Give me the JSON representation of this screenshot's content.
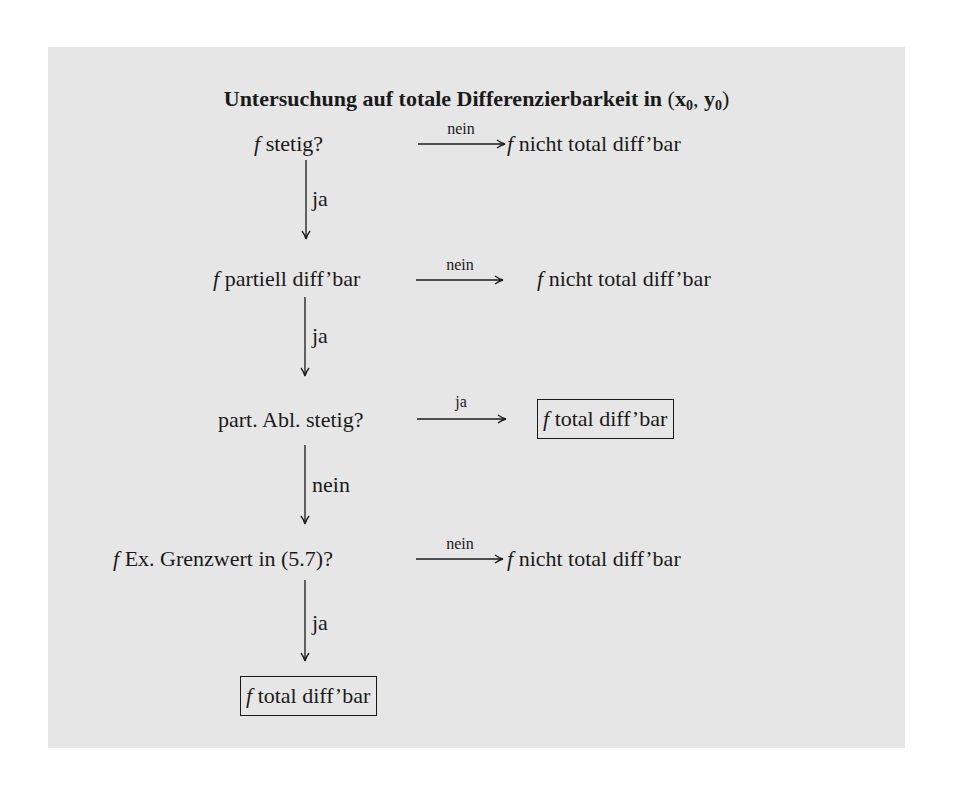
{
  "title": {
    "text": "Untersuchung auf totale Differenzierbarkeit in",
    "coords_open": "(",
    "x": "x",
    "x_sub": "0",
    "sep": ", ",
    "y": "y",
    "y_sub": "0",
    "coords_close": ")"
  },
  "rows": [
    {
      "question_f": "f",
      "question": " stetig?",
      "arrow_label": "nein",
      "result_f": "f",
      "result": " nicht total diff’bar",
      "result_boxed": false
    },
    {
      "question_f": "f",
      "question": " partiell diff’bar",
      "arrow_label": "nein",
      "result_f": "f",
      "result": " nicht total diff’bar",
      "result_boxed": false
    },
    {
      "question_f": "",
      "question": "part. Abl. stetig?",
      "arrow_label": "ja",
      "result_f": "f",
      "result": " total diff’bar",
      "result_boxed": true
    },
    {
      "question_f": "f",
      "question": " Ex. Grenzwert in (5.7)?",
      "arrow_label": "nein",
      "result_f": "f",
      "result": " nicht total diff’bar",
      "result_boxed": false
    }
  ],
  "down_arrows": [
    {
      "label": "ja"
    },
    {
      "label": "ja"
    },
    {
      "label": "nein"
    },
    {
      "label": "ja"
    }
  ],
  "final": {
    "f": "f",
    "text": " total diff’bar"
  },
  "colors": {
    "panel_background": "#e6e6e6",
    "ink": "#1a1a1a",
    "page_background": "#ffffff"
  }
}
